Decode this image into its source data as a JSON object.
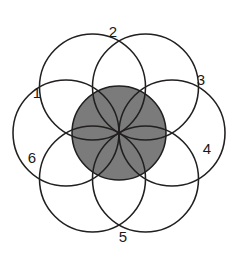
{
  "diagram": {
    "type": "venn-rosette",
    "canvas": {
      "width": 234,
      "height": 261,
      "background": "#ffffff"
    },
    "geometry": {
      "center_x": 119,
      "center_y": 133,
      "circle_radius": 53,
      "ring_distance": 53,
      "core_radius": 47,
      "circle_count": 6,
      "start_angle_deg": -90
    },
    "colors": {
      "stroke": "#221f1f",
      "background": "#ffffff",
      "core_light_gray": "#9d9d9d",
      "core_dark_gray": "#7b7b7b",
      "label": "#1a1a1a"
    },
    "circles": [
      {
        "id": "circle-1",
        "label": "1",
        "angle_deg": 180,
        "cx": 66,
        "cy": 133,
        "r": 53,
        "label_x": 37,
        "label_y": 94
      },
      {
        "id": "circle-2",
        "label": "2",
        "angle_deg": 240,
        "cx": 92.5,
        "cy": 87,
        "r": 53,
        "label_x": 113,
        "label_y": 33
      },
      {
        "id": "circle-3",
        "label": "3",
        "angle_deg": 300,
        "cx": 145.5,
        "cy": 87,
        "r": 53,
        "label_x": 201,
        "label_y": 81
      },
      {
        "id": "circle-4",
        "label": "4",
        "angle_deg": 0,
        "cx": 172,
        "cy": 133,
        "r": 53,
        "label_x": 207,
        "label_y": 150
      },
      {
        "id": "circle-5",
        "label": "5",
        "angle_deg": 60,
        "cx": 145.5,
        "cy": 179,
        "r": 53,
        "label_x": 123,
        "label_y": 238
      },
      {
        "id": "circle-6",
        "label": "6",
        "angle_deg": 120,
        "cx": 92.5,
        "cy": 179,
        "r": 53,
        "label_x": 32,
        "label_y": 159
      }
    ],
    "petals": [
      {
        "id": "petal-top",
        "a": "circle-2",
        "b": "circle-3"
      },
      {
        "id": "petal-upper-right",
        "a": "circle-3",
        "b": "circle-4"
      },
      {
        "id": "petal-lower-right",
        "a": "circle-4",
        "b": "circle-5"
      },
      {
        "id": "petal-bottom",
        "a": "circle-5",
        "b": "circle-6"
      },
      {
        "id": "petal-lower-left",
        "a": "circle-6",
        "b": "circle-1"
      },
      {
        "id": "petal-upper-left",
        "a": "circle-1",
        "b": "circle-2"
      }
    ]
  }
}
